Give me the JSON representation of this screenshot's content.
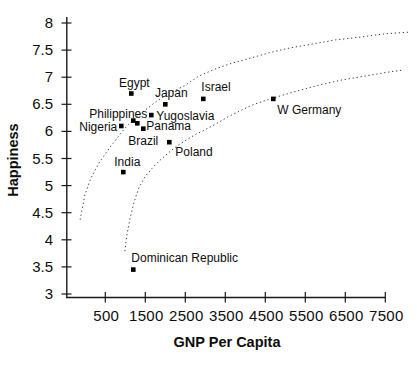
{
  "chart_data": {
    "type": "scatter",
    "title": "",
    "xlabel": "GNP Per Capita",
    "ylabel": "Happiness",
    "x_ticks": [
      500,
      1500,
      2500,
      3500,
      4500,
      5500,
      6500,
      7500
    ],
    "y_ticks": [
      3,
      3.5,
      4,
      4.5,
      5,
      5.5,
      6,
      6.5,
      7,
      7.5,
      8
    ],
    "xlim": [
      -480,
      7620
    ],
    "ylim": [
      2.94,
      8.1
    ],
    "grid": false,
    "legend": "none",
    "marker": "black-square",
    "points": [
      {
        "label": "Egypt",
        "gnp": 1150,
        "happiness": 6.7,
        "anchor": "middle",
        "dx": 3,
        "dy": -7
      },
      {
        "label": "Japan",
        "gnp": 2000,
        "happiness": 6.5,
        "anchor": "middle",
        "dx": 6,
        "dy": -7
      },
      {
        "label": "Israel",
        "gnp": 2950,
        "happiness": 6.6,
        "anchor": "start",
        "dx": -2,
        "dy": -8
      },
      {
        "label": "W Germany",
        "gnp": 4700,
        "happiness": 6.6,
        "anchor": "start",
        "dx": 4,
        "dy": 15
      },
      {
        "label": "Philippines",
        "gnp": 1200,
        "happiness": 6.2,
        "anchor": "end",
        "dx": 14,
        "dy": -3
      },
      {
        "label": "Yugoslavia",
        "gnp": 1650,
        "happiness": 6.3,
        "anchor": "start",
        "dx": 5,
        "dy": 4.5
      },
      {
        "label": "Nigeria",
        "gnp": 900,
        "happiness": 6.1,
        "anchor": "end",
        "dx": -4,
        "dy": 5
      },
      {
        "label": "Panama",
        "gnp": 1300,
        "happiness": 6.15,
        "anchor": "start",
        "dx": 9,
        "dy": 6.5
      },
      {
        "label": "Brazil",
        "gnp": 1450,
        "happiness": 6.05,
        "anchor": "middle",
        "dx": 0,
        "dy": 16
      },
      {
        "label": "Poland",
        "gnp": 2100,
        "happiness": 5.8,
        "anchor": "start",
        "dx": 6,
        "dy": 13.5
      },
      {
        "label": "India",
        "gnp": 950,
        "happiness": 5.25,
        "anchor": "middle",
        "dx": 4,
        "dy": -6.5
      },
      {
        "label": "Dominican Republic",
        "gnp": 1200,
        "happiness": 3.45,
        "anchor": "start",
        "dx": -2,
        "dy": -7.5
      }
    ],
    "curves": {
      "style": "dotted",
      "upper": [
        [
          -130,
          4.37
        ],
        [
          -10,
          4.83
        ],
        [
          140,
          5.14
        ],
        [
          370,
          5.45
        ],
        [
          620,
          5.71
        ],
        [
          970,
          6.04
        ],
        [
          1220,
          6.23
        ],
        [
          1490,
          6.39
        ],
        [
          1790,
          6.56
        ],
        [
          2120,
          6.71
        ],
        [
          2470,
          6.84
        ],
        [
          2840,
          7.02
        ],
        [
          3240,
          7.15
        ],
        [
          3670,
          7.26
        ],
        [
          4120,
          7.35
        ],
        [
          4590,
          7.45
        ],
        [
          5120,
          7.54
        ],
        [
          5670,
          7.61
        ],
        [
          6270,
          7.69
        ],
        [
          6870,
          7.74
        ],
        [
          7490,
          7.8
        ],
        [
          8070,
          7.83
        ]
      ],
      "lower": [
        [
          990,
          3.79
        ],
        [
          1040,
          4.09
        ],
        [
          1120,
          4.4
        ],
        [
          1220,
          4.7
        ],
        [
          1340,
          4.96
        ],
        [
          1490,
          5.16
        ],
        [
          1670,
          5.32
        ],
        [
          1870,
          5.47
        ],
        [
          2070,
          5.6
        ],
        [
          2290,
          5.73
        ],
        [
          2520,
          5.84
        ],
        [
          2770,
          5.95
        ],
        [
          3020,
          6.04
        ],
        [
          3270,
          6.14
        ],
        [
          3570,
          6.27
        ],
        [
          3870,
          6.38
        ],
        [
          4190,
          6.49
        ],
        [
          4540,
          6.58
        ],
        [
          4940,
          6.67
        ],
        [
          5370,
          6.76
        ],
        [
          5870,
          6.86
        ],
        [
          6420,
          6.95
        ],
        [
          6990,
          7.02
        ],
        [
          7620,
          7.1
        ],
        [
          7920,
          7.13
        ]
      ]
    }
  }
}
